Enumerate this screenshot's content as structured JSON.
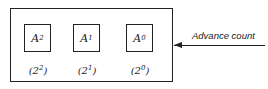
{
  "registers": [
    {
      "name": "A",
      "sub": "2",
      "weight_base": "2",
      "weight_exp": "2"
    },
    {
      "name": "A",
      "sub": "1",
      "weight_base": "2",
      "weight_exp": "1"
    },
    {
      "name": "A",
      "sub": "0",
      "weight_base": "2",
      "weight_exp": "0"
    }
  ],
  "input": {
    "label": "Advance count"
  }
}
